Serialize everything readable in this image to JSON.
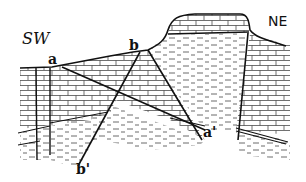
{
  "figure": {
    "type": "geological cross-section",
    "orientation": {
      "left": "SW",
      "right": "NE"
    },
    "labels": {
      "a": "a",
      "b": "b",
      "a_prime": "a'",
      "b_prime": "b'"
    },
    "faults": [
      {
        "id": "a-a'",
        "from": "a",
        "to": "a'"
      },
      {
        "id": "b-b'",
        "from": "b",
        "to": "b'"
      }
    ],
    "rock_patterns": [
      "limestone (brick pattern)",
      "shale (dashed pattern)"
    ],
    "colors": {
      "ink": "#111111",
      "background": "#ffffff"
    }
  }
}
